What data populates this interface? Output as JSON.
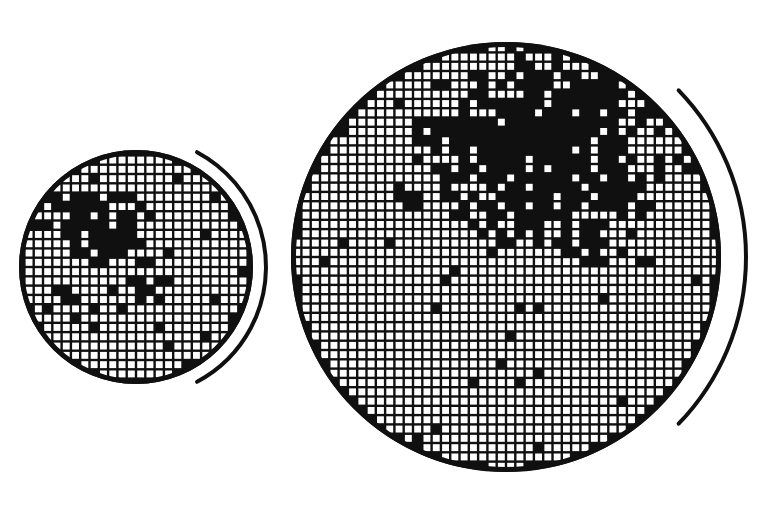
{
  "figure": {
    "background_color": "#ffffff",
    "ink_color": "#101010",
    "width": 781,
    "height": 509
  },
  "chart_data": {
    "type": "heatmap",
    "subtitle": "",
    "xlabel": "",
    "ylabel": "",
    "grid": true,
    "legend": null,
    "cell_states": {
      "pass": "open",
      "fail": "filled"
    },
    "colors": {
      "fail_cell": "#101010",
      "pass_cell": "#ffffff",
      "grid_line": "#101010",
      "wafer_edge": "#101010",
      "arc_marker": "#101010"
    },
    "wafers": [
      {
        "name": "small-wafer",
        "label": "left wafer",
        "center_x": 136,
        "center_y": 267,
        "radius": 117,
        "cell_pitch": 9.3,
        "grid_columns": 25,
        "grid_rows": 25,
        "edge_width": 5,
        "arc": {
          "radius": 130,
          "start_deg": -62,
          "end_deg": 62,
          "stroke_width": 4
        },
        "defect_clusters": [
          {
            "cx": -0.4,
            "cy": -0.44,
            "rx": 0.3,
            "ry": 0.22,
            "density": 0.95
          },
          {
            "cx": -0.18,
            "cy": -0.22,
            "rx": 0.22,
            "ry": 0.18,
            "density": 0.82
          },
          {
            "cx": -0.46,
            "cy": -0.06,
            "rx": 0.14,
            "ry": 0.12,
            "density": 0.55
          },
          {
            "cx": -0.62,
            "cy": 0.28,
            "rx": 0.13,
            "ry": 0.1,
            "density": 0.5
          },
          {
            "cx": 0.06,
            "cy": -0.04,
            "rx": 0.11,
            "ry": 0.09,
            "density": 0.45
          },
          {
            "cx": -0.05,
            "cy": 0.22,
            "rx": 0.16,
            "ry": 0.08,
            "density": 0.42
          }
        ],
        "scatter_defect_rate": 0.055,
        "seed": 20471
      },
      {
        "name": "large-wafer",
        "label": "right wafer",
        "center_x": 506,
        "center_y": 257,
        "radius": 215,
        "cell_pitch": 9.3,
        "grid_columns": 47,
        "grid_rows": 47,
        "edge_width": 5,
        "arc": {
          "radius": 240,
          "start_deg": -44,
          "end_deg": 44,
          "stroke_width": 4
        },
        "defect_clusters": [
          {
            "cx": 0.3,
            "cy": -0.62,
            "rx": 0.34,
            "ry": 0.26,
            "density": 0.97
          },
          {
            "cx": 0.02,
            "cy": -0.58,
            "rx": 0.26,
            "ry": 0.22,
            "density": 0.88
          },
          {
            "cx": 0.2,
            "cy": -0.3,
            "rx": 0.3,
            "ry": 0.22,
            "density": 0.8
          },
          {
            "cx": -0.22,
            "cy": -0.6,
            "rx": 0.18,
            "ry": 0.16,
            "density": 0.6
          },
          {
            "cx": 0.52,
            "cy": -0.32,
            "rx": 0.16,
            "ry": 0.16,
            "density": 0.55
          },
          {
            "cx": -0.05,
            "cy": -0.18,
            "rx": 0.16,
            "ry": 0.12,
            "density": 0.45
          },
          {
            "cx": 0.4,
            "cy": -0.06,
            "rx": 0.13,
            "ry": 0.1,
            "density": 0.38
          },
          {
            "cx": -0.4,
            "cy": -0.26,
            "rx": 0.12,
            "ry": 0.1,
            "density": 0.35
          }
        ],
        "scatter_defect_rate": 0.022,
        "seed": 91733
      }
    ]
  }
}
